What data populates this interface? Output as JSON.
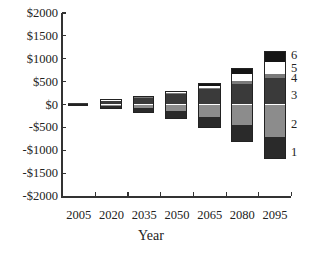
{
  "chart_data": {
    "type": "bar",
    "stacked": true,
    "title": "",
    "xlabel": "Year",
    "ylabel": "",
    "ylim": [
      -2000,
      2000
    ],
    "yticks": [
      "$2000",
      "$1500",
      "$1000",
      "$500",
      "$0",
      "-$500",
      "-$1000",
      "-$1500",
      "-$2000"
    ],
    "ytick_values": [
      2000,
      1500,
      1000,
      500,
      0,
      -500,
      -1000,
      -1500,
      -2000
    ],
    "categories": [
      "2005",
      "2020",
      "2035",
      "2050",
      "2065",
      "2080",
      "2095"
    ],
    "series": [
      {
        "name": "1",
        "color": "#2a2a2a",
        "values": [
          -25,
          -60,
          -120,
          -160,
          -240,
          -370,
          -500
        ]
      },
      {
        "name": "2",
        "color": "#8c8c8c",
        "values": [
          0,
          -30,
          -70,
          -150,
          -280,
          -455,
          -700
        ]
      },
      {
        "name": "3",
        "color": "#3a3a3a",
        "values": [
          25,
          95,
          160,
          230,
          330,
          455,
          585
        ]
      },
      {
        "name": "4",
        "color": "#7a7a7a",
        "values": [
          0,
          5,
          10,
          15,
          20,
          65,
          90
        ]
      },
      {
        "name": "5",
        "color": "#ffffff",
        "values": [
          0,
          5,
          10,
          25,
          45,
          150,
          260
        ]
      },
      {
        "name": "6",
        "color": "#151515",
        "values": [
          0,
          5,
          15,
          35,
          85,
          130,
          240
        ]
      }
    ],
    "segment_labels": [
      "1",
      "2",
      "3",
      "4",
      "5",
      "6"
    ],
    "legend_position": "right (inline labels beside last bar)",
    "grid": false
  }
}
